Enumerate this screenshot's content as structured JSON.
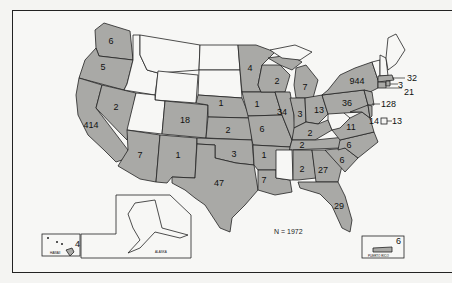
{
  "map": {
    "title": "",
    "total_label": "N = 1972",
    "colors": {
      "shaded": "#a9a9a6",
      "unshaded": "#f7f7f5",
      "border": "#222222"
    },
    "states": [
      {
        "abbr": "WASH",
        "count": "6"
      },
      {
        "abbr": "OREG",
        "count": "5"
      },
      {
        "abbr": "CALIF",
        "count": "414"
      },
      {
        "abbr": "NEV",
        "count": "2"
      },
      {
        "abbr": "ARIZ",
        "count": "7"
      },
      {
        "abbr": "N MEX",
        "count": "1"
      },
      {
        "abbr": "COLO",
        "count": "18"
      },
      {
        "abbr": "TEX",
        "count": "47"
      },
      {
        "abbr": "OKLA",
        "count": "3"
      },
      {
        "abbr": "KANS",
        "count": "2"
      },
      {
        "abbr": "NEBR",
        "count": "1"
      },
      {
        "abbr": "MINN",
        "count": "4"
      },
      {
        "abbr": "IOWA",
        "count": "1"
      },
      {
        "abbr": "MO",
        "count": "6"
      },
      {
        "abbr": "WIS",
        "count": "2"
      },
      {
        "abbr": "ILL",
        "count": "34"
      },
      {
        "abbr": "MICH",
        "count": "7"
      },
      {
        "abbr": "IND",
        "count": "3"
      },
      {
        "abbr": "OHIO",
        "count": "13"
      },
      {
        "abbr": "KY",
        "count": "2"
      },
      {
        "abbr": "TENN",
        "count": "2"
      },
      {
        "abbr": "ARK",
        "count": "1"
      },
      {
        "abbr": "LA",
        "count": "7"
      },
      {
        "abbr": "ALA",
        "count": "2"
      },
      {
        "abbr": "GA",
        "count": "27"
      },
      {
        "abbr": "S C",
        "count": "6"
      },
      {
        "abbr": "N C",
        "count": "6"
      },
      {
        "abbr": "VA",
        "count": "11"
      },
      {
        "abbr": "PA",
        "count": "36"
      },
      {
        "abbr": "N Y",
        "count": "944"
      },
      {
        "abbr": "MASS",
        "count": "32"
      },
      {
        "abbr": "R I",
        "count": "3"
      },
      {
        "abbr": "CONN",
        "count": "21"
      },
      {
        "abbr": "N J",
        "count": "128"
      },
      {
        "abbr": "MD",
        "count": "14"
      },
      {
        "abbr": "D C",
        "count": "13"
      },
      {
        "abbr": "FLA",
        "count": "29"
      },
      {
        "abbr": "HAWAII",
        "count": "4"
      },
      {
        "abbr": "PUERTO RICO",
        "count": "6"
      }
    ],
    "unshaded_states": [
      "IDAHO",
      "MONT",
      "WYO",
      "UTAH",
      "N DAK",
      "S DAK",
      "MISS",
      "W VA",
      "MAINE",
      "VT",
      "N H",
      "ALASKA"
    ],
    "inset_labels": {
      "hawaii": "HAWAII",
      "alaska": "ALASKA",
      "puerto_rico": "PUERTO RICO"
    }
  }
}
